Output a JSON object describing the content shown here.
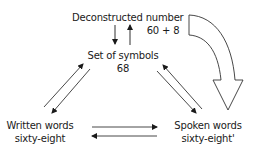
{
  "diagram": {
    "nodes": {
      "deconstructed": {
        "title": "Deconstructed number",
        "value": "60 + 8"
      },
      "symbols": {
        "title": "Set of symbols",
        "value": "68"
      },
      "written": {
        "title": "Written words",
        "value": "sixty-eight"
      },
      "spoken": {
        "title": "Spoken words",
        "value": "sixty-eight'"
      }
    },
    "edges": [
      {
        "from": "symbols",
        "to": "deconstructed",
        "direction": "up"
      },
      {
        "from": "deconstructed",
        "to": "symbols",
        "direction": "down"
      },
      {
        "from": "written",
        "to": "symbols",
        "direction": "up-right"
      },
      {
        "from": "symbols",
        "to": "written",
        "direction": "down-left"
      },
      {
        "from": "spoken",
        "to": "symbols",
        "direction": "up-left"
      },
      {
        "from": "symbols",
        "to": "spoken",
        "direction": "down-right"
      },
      {
        "from": "written",
        "to": "spoken",
        "direction": "right"
      },
      {
        "from": "spoken",
        "to": "written",
        "direction": "left"
      },
      {
        "from": "deconstructed",
        "to": "spoken",
        "style": "large hollow curved arrow"
      }
    ],
    "colors": {
      "line": "#1a1a1a",
      "background": "#ffffff"
    }
  }
}
